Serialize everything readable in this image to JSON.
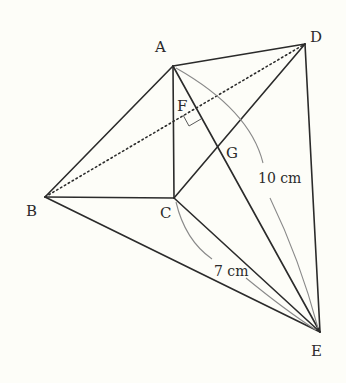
{
  "diagram": {
    "background": "#fdfdf8",
    "line_color": "#2b2b2b",
    "arc_color": "#8a8a8a",
    "points": {
      "A": {
        "label": "A",
        "x": 173,
        "y": 66
      },
      "B": {
        "label": "B",
        "x": 45,
        "y": 197
      },
      "C": {
        "label": "C",
        "x": 174,
        "y": 198
      },
      "D": {
        "label": "D",
        "x": 305,
        "y": 44
      },
      "E": {
        "label": "E",
        "x": 320,
        "y": 332
      },
      "F": {
        "label": "F",
        "x": 195,
        "y": 108
      },
      "G": {
        "label": "G",
        "x": 216,
        "y": 144
      }
    },
    "segments": [
      "AB",
      "AC",
      "AD",
      "AE",
      "BC",
      "BE",
      "CD",
      "CE",
      "DE"
    ],
    "dotted_segments": [
      "BD"
    ],
    "right_angle_at": "F",
    "measurements": [
      {
        "segment": "AE",
        "label": "10 cm"
      },
      {
        "segment": "CE",
        "label": "7 cm"
      }
    ]
  }
}
